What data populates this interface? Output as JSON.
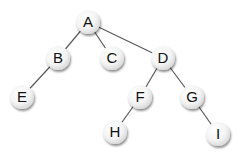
{
  "diagram": {
    "type": "tree",
    "colors": {
      "edge": "#5a5a5a",
      "node_fill_center": "#ffffff",
      "node_fill_edge": "#d6d6d6",
      "node_shadow": "#9a9a9a",
      "label": "#111111"
    },
    "node_radius": 12,
    "nodes": [
      {
        "id": "A",
        "label": "A",
        "x": 88,
        "y": 22
      },
      {
        "id": "B",
        "label": "B",
        "x": 58,
        "y": 58
      },
      {
        "id": "C",
        "label": "C",
        "x": 112,
        "y": 58
      },
      {
        "id": "D",
        "label": "D",
        "x": 163,
        "y": 58
      },
      {
        "id": "E",
        "label": "E",
        "x": 22,
        "y": 97
      },
      {
        "id": "F",
        "label": "F",
        "x": 140,
        "y": 97
      },
      {
        "id": "G",
        "label": "G",
        "x": 192,
        "y": 97
      },
      {
        "id": "H",
        "label": "H",
        "x": 115,
        "y": 132
      },
      {
        "id": "I",
        "label": "I",
        "x": 218,
        "y": 134
      }
    ],
    "edges": [
      {
        "from": "A",
        "to": "B"
      },
      {
        "from": "A",
        "to": "C"
      },
      {
        "from": "A",
        "to": "D"
      },
      {
        "from": "B",
        "to": "E"
      },
      {
        "from": "D",
        "to": "F"
      },
      {
        "from": "D",
        "to": "G"
      },
      {
        "from": "F",
        "to": "H"
      },
      {
        "from": "G",
        "to": "I"
      }
    ]
  }
}
